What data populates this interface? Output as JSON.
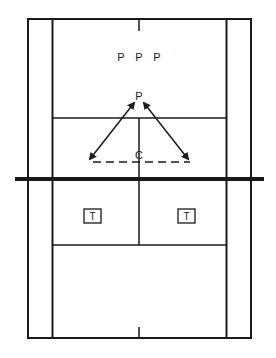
{
  "diagram": {
    "type": "badminton-court-drill",
    "colors": {
      "line": "#1a1a1a",
      "background": "#ffffff"
    },
    "players_queue": [
      {
        "label": "P",
        "x": 121,
        "y": 61
      },
      {
        "label": "P",
        "x": 139,
        "y": 61
      },
      {
        "label": "P",
        "x": 157,
        "y": 61
      }
    ],
    "active_player": {
      "label": "P",
      "x": 139,
      "y": 100
    },
    "coach": {
      "label": "C",
      "x": 139,
      "y": 159
    },
    "targets": [
      {
        "label": "T",
        "x": 84,
        "y": 209,
        "w": 17,
        "h": 14
      },
      {
        "label": "T",
        "x": 178,
        "y": 209,
        "w": 17,
        "h": 14
      }
    ],
    "arrows": [
      {
        "name": "arrow-left",
        "from": [
          135,
          101
        ],
        "to": [
          89,
          160
        ],
        "bidirectional": true
      },
      {
        "name": "arrow-right",
        "from": [
          143,
          101
        ],
        "to": [
          189,
          160
        ],
        "bidirectional": true
      }
    ],
    "dashed_line": {
      "from": [
        92,
        162
      ],
      "to": [
        190,
        162
      ]
    }
  }
}
